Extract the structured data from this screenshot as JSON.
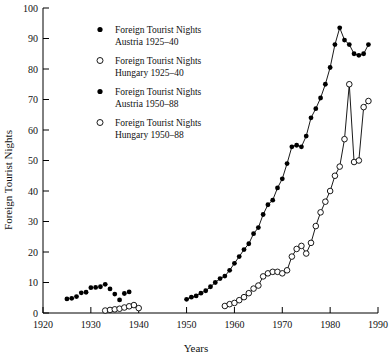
{
  "chart_data": {
    "type": "scatter",
    "title": "",
    "xlabel": "Years",
    "ylabel": "Foreign Tourist Nights",
    "xlim": [
      1920,
      1990
    ],
    "ylim": [
      0,
      100
    ],
    "xticks": [
      1920,
      1930,
      1940,
      1950,
      1960,
      1970,
      1980,
      1990
    ],
    "yticks": [
      0,
      10,
      20,
      30,
      40,
      50,
      60,
      70,
      80,
      90,
      100
    ],
    "grid": false,
    "legend_position": "upper-left-inside",
    "series": [
      {
        "name": "Foreign Tourist Nights Austria 1925-40",
        "marker": "filled-circle",
        "line": false,
        "x": [
          1925,
          1926,
          1927,
          1928,
          1929,
          1930,
          1931,
          1932,
          1933,
          1934,
          1935,
          1936,
          1937,
          1938
        ],
        "values": [
          4.6,
          4.8,
          5.4,
          6.6,
          6.8,
          8.3,
          8.4,
          8.6,
          9.4,
          7.9,
          6.2,
          4.3,
          6.4,
          6.9
        ]
      },
      {
        "name": "Foreign Tourist Nights Hungary 1925-40",
        "marker": "open-circle",
        "line": false,
        "x": [
          1933,
          1934,
          1935,
          1936,
          1937,
          1938,
          1939,
          1940
        ],
        "values": [
          0.8,
          1.0,
          1.2,
          1.4,
          1.8,
          2.2,
          2.6,
          1.6
        ]
      },
      {
        "name": "Foreign Tourist Nights Austria 1950-88",
        "marker": "filled-circle",
        "line": true,
        "x": [
          1950,
          1951,
          1952,
          1953,
          1954,
          1955,
          1956,
          1957,
          1958,
          1959,
          1960,
          1961,
          1962,
          1963,
          1964,
          1965,
          1966,
          1967,
          1968,
          1969,
          1970,
          1971,
          1972,
          1973,
          1974,
          1975,
          1976,
          1977,
          1978,
          1979,
          1980,
          1981,
          1982,
          1983,
          1984,
          1985,
          1986,
          1987,
          1988
        ],
        "values": [
          4.5,
          5.2,
          5.6,
          6.5,
          7.3,
          8.6,
          10.0,
          11.3,
          12.1,
          14.0,
          16.3,
          18.5,
          20.8,
          22.7,
          26.0,
          28.0,
          32.3,
          35.5,
          37.0,
          41.0,
          44.0,
          49.0,
          54.5,
          55.0,
          54.5,
          58.0,
          64.0,
          67.0,
          70.5,
          75.0,
          80.5,
          88.0,
          93.5,
          89.5,
          88.0,
          85.0,
          84.5,
          85.0,
          88.0
        ]
      },
      {
        "name": "Foreign Tourist Nights Hungary 1950-88",
        "marker": "open-circle",
        "line": true,
        "x": [
          1958,
          1959,
          1960,
          1961,
          1962,
          1963,
          1964,
          1965,
          1966,
          1967,
          1968,
          1969,
          1970,
          1971,
          1972,
          1973,
          1974,
          1975,
          1976,
          1977,
          1978,
          1979,
          1980,
          1981,
          1982,
          1983,
          1984,
          1985,
          1986,
          1987,
          1988
        ],
        "values": [
          2.3,
          2.9,
          3.3,
          4.2,
          5.2,
          6.5,
          8.0,
          9.0,
          12.0,
          13.0,
          13.5,
          13.5,
          13.0,
          14.0,
          18.5,
          21.0,
          22.0,
          19.5,
          23.0,
          28.5,
          33.0,
          36.5,
          40.0,
          45.0,
          48.0,
          57.0,
          75.0,
          49.5,
          50.0,
          67.5,
          69.5
        ]
      }
    ]
  },
  "legend": {
    "entries": [
      {
        "marker": "filled-circle",
        "line1": "Foreign Tourist Nights",
        "line2": "Austria 1925–40"
      },
      {
        "marker": "open-circle",
        "line1": "Foreign Tourist Nights",
        "line2": "Hungary 1925–40"
      },
      {
        "marker": "filled-circle",
        "line1": "Foreign Tourist Nights",
        "line2": "Austria 1950–88"
      },
      {
        "marker": "open-circle",
        "line1": "Foreign Tourist Nights",
        "line2": "Hungary 1950–88"
      }
    ]
  },
  "colors": {
    "axis": "#000000",
    "marker_fill": "#000000",
    "marker_open": "#ffffff",
    "line": "#000000",
    "background": "#ffffff"
  }
}
